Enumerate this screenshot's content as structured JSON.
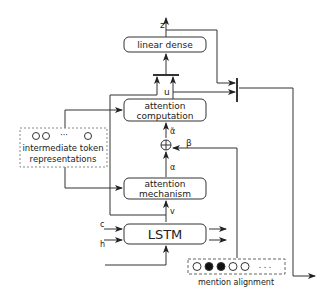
{
  "nodes": {
    "linear_dense": {
      "label": "linear dense"
    },
    "attention_computation": {
      "line1": "attention",
      "line2": "computation"
    },
    "attention_mechanism": {
      "line1": "attention",
      "line2": "mechanism"
    },
    "lstm": {
      "label": "LSTM"
    },
    "intermediate": {
      "dots": "···",
      "line1": "intermediate token",
      "line2": "representations"
    },
    "mention_alignment": {
      "label": "mention alignment",
      "dots": ". . ."
    }
  },
  "labels": {
    "z": "z",
    "u": "u",
    "alpha_tilde": "α̃",
    "alpha": "α",
    "beta": "β",
    "v": "v",
    "c": "c",
    "h": "h",
    "plus": "⊕"
  },
  "colors": {
    "stroke": "#333333",
    "text": "#222222",
    "fill_dot": "#111111"
  }
}
